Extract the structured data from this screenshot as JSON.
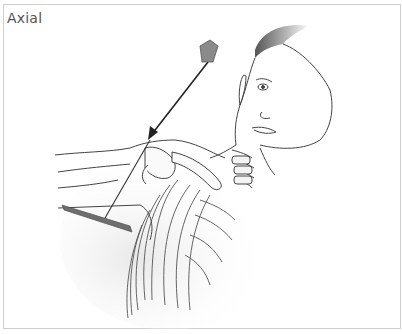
{
  "figure": {
    "view_label": "Axial",
    "elements": {
      "x_ray_tube": "tube-icon",
      "central_ray": "arrow-icon",
      "image_receptor": "detector-plate-icon"
    }
  },
  "colors": {
    "frame_border": "#cfcfcf",
    "label_text": "#555555",
    "line_art": "#444444",
    "tube_fill": "#8a8a8a",
    "detector_fill": "#6e6e6e",
    "hair": "#707070"
  }
}
